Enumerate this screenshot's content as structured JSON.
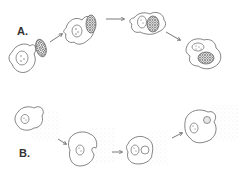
{
  "diagram": {
    "panels": [
      {
        "id": "A",
        "label": "A.",
        "process": "phagocytosis",
        "stages": [
          "particle approaches cell",
          "particle contacts cell",
          "particle engulfed",
          "phagosome formed in cell"
        ]
      },
      {
        "id": "B",
        "label": "B.",
        "process": "fluid uptake",
        "stages": [
          "cell in fluid",
          "cell invaginates",
          "vesicle forming",
          "vesicle internalized"
        ]
      }
    ],
    "colors": {
      "line": "#666666",
      "background": "#ffffff",
      "fluid_stipple": "#cccccc"
    }
  }
}
